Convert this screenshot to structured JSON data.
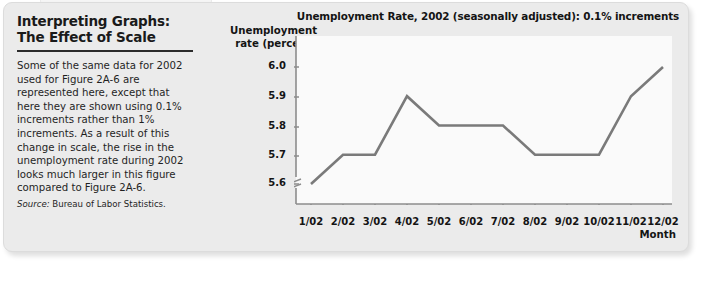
{
  "card": {
    "background_color": "#ebebeb"
  },
  "sidebar": {
    "title": "Interpreting Graphs:\nThe Effect of Scale",
    "body": "Some of the same data for 2002 used for Figure 2A-6 are represented here, except that here they are shown using 0.1% increments rather than 1% increments. As a result of this change in scale, the rise in the unemployment rate during 2002 looks much larger in this figure compared to Figure 2A-6.",
    "source_label": "Source:",
    "source_text": " Bureau of Labor Statistics."
  },
  "chart_data": {
    "type": "line",
    "title": "Unemployment Rate, 2002 (seasonally adjusted): 0.1% increments",
    "xlabel": "Month",
    "ylabel": "Unemployment\nrate (percent)",
    "categories": [
      "1/02",
      "2/02",
      "3/02",
      "4/02",
      "5/02",
      "6/02",
      "7/02",
      "8/02",
      "9/02",
      "10/02",
      "11/02",
      "12/02"
    ],
    "values": [
      5.6,
      5.7,
      5.7,
      5.9,
      5.8,
      5.8,
      5.8,
      5.7,
      5.7,
      5.7,
      5.9,
      6.0
    ],
    "ytick_labels": [
      "6.0",
      "5.9",
      "5.8",
      "5.7",
      "5.6"
    ],
    "ytick_values": [
      6.0,
      5.9,
      5.8,
      5.7,
      5.6
    ],
    "ylim": [
      5.55,
      6.05
    ],
    "axis_break": true,
    "grid": false,
    "legend": "none",
    "line_color": "#7a7a7a",
    "plot_background": "#fafafa",
    "increment": 0.1
  }
}
